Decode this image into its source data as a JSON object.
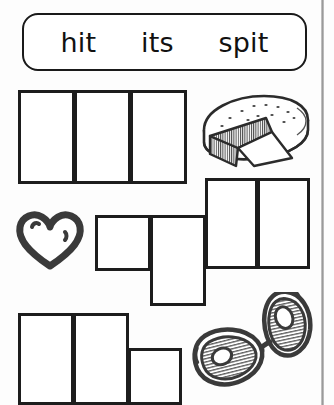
{
  "worksheet": {
    "title": "Short i CVC Word Box Worksheet",
    "background_color": "#fdfdfd",
    "ink_color": "#1d1d1d"
  },
  "word_bank": {
    "name": "word-bank",
    "words": [
      {
        "text": "hit"
      },
      {
        "text": "its"
      },
      {
        "text": "spit"
      }
    ]
  },
  "rows": [
    {
      "id": "row-1",
      "answer_hint": "hit",
      "picture": {
        "name": "cheese-wheel-icon",
        "label": "cheese wheel with a cut wedge"
      },
      "boxes": [
        {
          "label": "box-1-a"
        },
        {
          "label": "box-1-b"
        },
        {
          "label": "box-1-c"
        }
      ]
    },
    {
      "id": "row-2",
      "answer_hint": "its",
      "picture": {
        "name": "heart-icon",
        "label": "heart outline"
      },
      "boxes": [
        {
          "label": "box-2-a"
        },
        {
          "label": "box-2-b"
        },
        {
          "label": "box-2-c"
        },
        {
          "label": "box-2-d"
        }
      ]
    },
    {
      "id": "row-3",
      "answer_hint": "spit",
      "picture": {
        "name": "sunglasses-icon",
        "label": "pair of sunglasses"
      },
      "boxes": [
        {
          "label": "box-3-a"
        },
        {
          "label": "box-3-b"
        },
        {
          "label": "box-3-c"
        }
      ]
    }
  ]
}
